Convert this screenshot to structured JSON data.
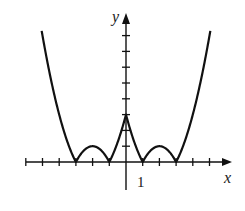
{
  "chart_data": {
    "type": "line",
    "title": "",
    "xlabel": "x",
    "ylabel": "y",
    "function": "y = |x^2 - 4|x| + 3|",
    "x_tick_labels": [
      {
        "x": 1,
        "label": "1"
      }
    ],
    "x_ticks": [
      -6,
      -5,
      -4,
      -3,
      -2,
      -1,
      1,
      2,
      3,
      4,
      5
    ],
    "y_ticks": [
      1,
      2,
      3,
      4,
      5,
      6,
      7,
      8
    ],
    "xlim": [
      -6.3,
      7.0
    ],
    "ylim": [
      -1.5,
      9.0
    ],
    "grid": false,
    "legend": null,
    "key_points": [
      {
        "x": -5,
        "y": 8
      },
      {
        "x": -3,
        "y": 0
      },
      {
        "x": -2,
        "y": 1
      },
      {
        "x": -1,
        "y": 0
      },
      {
        "x": 0,
        "y": 3
      },
      {
        "x": 1,
        "y": 0
      },
      {
        "x": 2,
        "y": 1
      },
      {
        "x": 3,
        "y": 0
      },
      {
        "x": 5,
        "y": 8
      }
    ],
    "series": [
      {
        "name": "f(x)",
        "x": [
          -5,
          -4.5,
          -4,
          -3.5,
          -3,
          -2.5,
          -2,
          -1.5,
          -1,
          -0.5,
          0,
          0.5,
          1,
          1.5,
          2,
          2.5,
          3,
          3.5,
          4,
          4.5,
          5
        ],
        "values": [
          8,
          5.25,
          3,
          1.25,
          0,
          0.75,
          1,
          0.75,
          0,
          1.25,
          3,
          1.25,
          0,
          0.75,
          1,
          0.75,
          0,
          1.25,
          3,
          5.25,
          8
        ]
      }
    ]
  },
  "labels": {
    "x_axis": "x",
    "y_axis": "y",
    "one": "1"
  }
}
